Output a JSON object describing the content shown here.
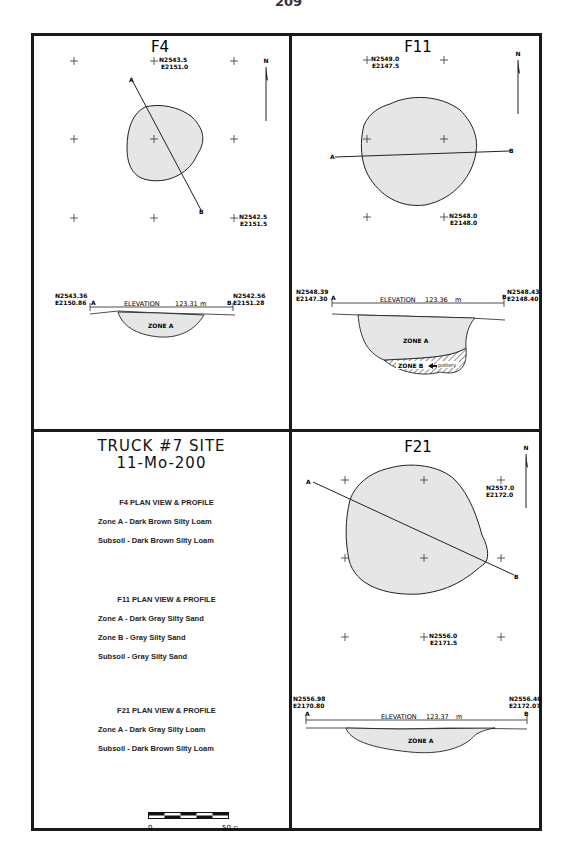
{
  "page": {
    "number": "209"
  },
  "panels": [
    {
      "id": "F4",
      "title": "F4",
      "north_label": "N",
      "grid_labels": [
        {
          "n": "N2543.5",
          "e": "E2151.0"
        },
        {
          "n": "N2542.5",
          "e": "E2151.5"
        }
      ],
      "section_labels": {
        "a": "A",
        "b": "B"
      },
      "profile": {
        "left_coord": {
          "n": "N2543.36",
          "e": "E2150.86"
        },
        "right_coord": {
          "n": "N2542.56",
          "e": "E2151.28"
        },
        "elevation_label": "ELEVATION",
        "elevation_value": "123.31",
        "elevation_unit": "m",
        "zones": [
          "ZONE A"
        ]
      }
    },
    {
      "id": "F11",
      "title": "F11",
      "north_label": "N",
      "grid_labels": [
        {
          "n": "N2549.0",
          "e": "E2147.5"
        },
        {
          "n": "N2548.0",
          "e": "E2148.0"
        }
      ],
      "section_labels": {
        "a": "A",
        "b": "B"
      },
      "profile": {
        "left_coord": {
          "n": "N2548.39",
          "e": "E2147.30"
        },
        "right_coord": {
          "n": "N2548.43",
          "e": "E2148.40"
        },
        "elevation_label": "ELEVATION",
        "elevation_value": "123.36",
        "elevation_unit": "m",
        "zones": [
          "ZONE A",
          "ZONE B"
        ],
        "annotation": "pottery"
      }
    },
    {
      "id": "F21",
      "title": "F21",
      "north_label": "N",
      "grid_labels": [
        {
          "n": "N2557.0",
          "e": "E2172.0"
        },
        {
          "n": "N2556.0",
          "e": "E2171.5"
        }
      ],
      "section_labels": {
        "a": "A",
        "b": "B"
      },
      "profile": {
        "left_coord": {
          "n": "N2556.98",
          "e": "E2170.80"
        },
        "right_coord": {
          "n": "N2556.40",
          "e": "E2172.07"
        },
        "elevation_label": "ELEVATION",
        "elevation_value": "123.37",
        "elevation_unit": "m",
        "zones": [
          "ZONE A"
        ]
      }
    }
  ],
  "legend": {
    "site_title": "TRUCK #7 SITE",
    "site_number": "11-Mo-200",
    "sections": [
      {
        "heading": "F4  PLAN VIEW & PROFILE",
        "lines": [
          "Zone A - Dark Brown Silty Loam",
          "Subsoil - Dark Brown Silty Loam"
        ]
      },
      {
        "heading": "F11  PLAN VIEW & PROFILE",
        "lines": [
          "Zone A - Dark Gray Silty Sand",
          "Zone B - Gray Silty Sand",
          "Subsoil - Gray Silty Sand"
        ]
      },
      {
        "heading": "F21 PLAN VIEW & PROFILE",
        "lines": [
          "Zone A - Dark Gray Silty Loam",
          "Subsoil - Dark Brown Silty Loam"
        ]
      }
    ],
    "scale": {
      "min": "0",
      "max": "50 cm"
    }
  },
  "colors": {
    "fill": "#e6e6e6",
    "ink": "#1a1a1a"
  }
}
